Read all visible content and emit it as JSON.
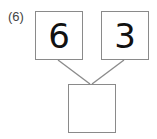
{
  "problem": {
    "label": "(6)",
    "left_value": "6",
    "right_value": "3",
    "bottom_value": ""
  }
}
